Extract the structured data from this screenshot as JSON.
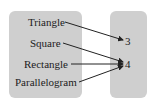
{
  "diagram": {
    "type": "mapping",
    "colors": {
      "box_fill": "#cfcfcf",
      "text": "#1c1c1c",
      "arrow": "#222222",
      "background": "#ffffff"
    },
    "domain": {
      "items": [
        {
          "label": "Triangle"
        },
        {
          "label": "Square"
        },
        {
          "label": "Rectangle"
        },
        {
          "label": "Parallelogram"
        }
      ]
    },
    "range": {
      "items": [
        {
          "label": "3"
        },
        {
          "label": "4"
        }
      ]
    },
    "mappings": [
      {
        "from": "Triangle",
        "to": "3"
      },
      {
        "from": "Square",
        "to": "4"
      },
      {
        "from": "Rectangle",
        "to": "4"
      },
      {
        "from": "Parallelogram",
        "to": "4"
      }
    ]
  }
}
